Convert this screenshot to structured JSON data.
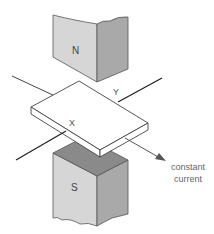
{
  "diagram": {
    "labels": {
      "north_pole": "N",
      "south_pole": "S",
      "point_x": "X",
      "point_y": "Y",
      "current_line1": "constant",
      "current_line2": "current"
    },
    "colors": {
      "magnet_front": "#d6d6d6",
      "magnet_side": "#a9a9a9",
      "magnet_top": "#8a8a8a",
      "slab": "#ffffff",
      "line": "#333333"
    }
  }
}
